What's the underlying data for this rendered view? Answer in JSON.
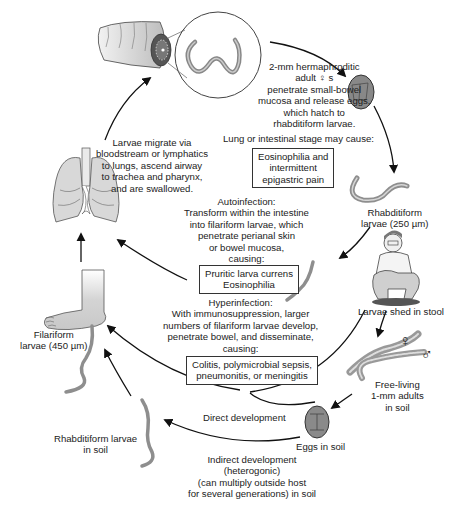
{
  "diagram": {
    "adults_in_gut": {
      "lines": [
        "2-mm hermaphroditic",
        "adult ♀ s",
        "penetrate small-bowel",
        "mucosa and release eggs,",
        "which hatch to",
        "rhabditiform larvae."
      ]
    },
    "lung_stage_note": "Lung or intestinal stage may cause:",
    "lung_stage_box": [
      "Eosinophilia and",
      "intermittent",
      "epigastric pain"
    ],
    "migration": {
      "lines": [
        "Larvae migrate via",
        "bloodstream or lymphatics",
        "to lungs, ascend airway",
        "to trachea and pharynx,",
        "and are swallowed."
      ]
    },
    "rhabditiform_larvae": [
      "Rhabditiform",
      "larvae (250 µm)"
    ],
    "autoinfection": {
      "lines": [
        "Autoinfection:",
        "Transform within the intestine",
        "into filariform larvae, which",
        "penetrate perianal skin",
        "or bowel mucosa,",
        "causing:"
      ],
      "box": [
        "Pruritic larva currens",
        "Eosinophilia"
      ]
    },
    "larvae_shed": "Larvae shed in stool",
    "hyperinfection": {
      "lines": [
        "Hyperinfection:",
        "With immunosuppression, larger",
        "numbers of filariform larvae develop,",
        "penetrate bowel, and disseminate,",
        "causing:"
      ],
      "box": [
        "Colitis, polymicrobial sepsis,",
        "pneumonitis, or meningitis"
      ]
    },
    "filariform_larvae": [
      "Filariform",
      "larvae (450 µm)"
    ],
    "free_living_adults": [
      "Free-living",
      "1-mm adults",
      "in soil"
    ],
    "female_symbol": "♀",
    "male_symbol": "♂",
    "direct_development": "Direct development",
    "eggs_in_soil": "Eggs in soil",
    "rhabditiform_soil": [
      "Rhabditiform larvae",
      "in soil"
    ],
    "indirect_development": [
      "Indirect development",
      "(heterogonic)",
      "(can multiply outside host",
      "for several generations) in soil"
    ],
    "colors": {
      "arrow": "#111111",
      "worm_fill": "#9a9a9a",
      "organ_fill": "#d8d8d8",
      "egg_fill": "#8f8f8f",
      "box_border": "#333333"
    }
  }
}
